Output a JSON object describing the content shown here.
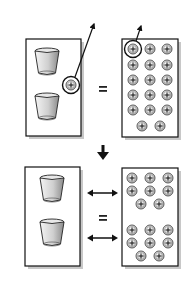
{
  "diagram": {
    "colors": {
      "background": "#ffffff",
      "stroke": "#111111",
      "shadow": "#c8c8c8",
      "cup_light": "#f2f2f2",
      "cup_dark": "#8a8a8a",
      "ion_fill": "#e6e6e6"
    },
    "top_panel": {
      "left_box": {
        "label": "two-cups-with-one-ion-box",
        "cups": 2,
        "highlighted_ion": "+"
      },
      "equals": "=",
      "right_box": {
        "label": "ion-grid-box",
        "ion_symbol": "+",
        "ion_count": 17,
        "rows": [
          3,
          3,
          3,
          3,
          3,
          2
        ],
        "highlighted_ion_position": "top-left"
      },
      "escape_arrows": 2
    },
    "transition_arrow": "down-arrow",
    "bottom_panel": {
      "left_box": {
        "label": "two-cups-box",
        "cups": 2
      },
      "equals": "=",
      "double_arrows": 2,
      "right_box": {
        "label": "split-ion-box",
        "ion_symbol": "+",
        "groups": [
          {
            "ion_count": 8,
            "rows": [
              3,
              3,
              2
            ]
          },
          {
            "ion_count": 8,
            "rows": [
              3,
              3,
              2
            ]
          }
        ]
      }
    }
  }
}
